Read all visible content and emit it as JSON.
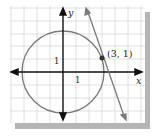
{
  "figure": {
    "axes": {
      "x_label": "x",
      "y_label": "y",
      "x_tick_label": "1",
      "y_tick_label": "1"
    },
    "circle": {
      "center": [
        0,
        0
      ],
      "radius_squared": 10,
      "color": "#7a7a7a"
    },
    "tangent_line": {
      "through": [
        3,
        1
      ],
      "slope": -3,
      "color": "#7a7a7a"
    },
    "point": {
      "label": "(3, 1)",
      "x": 3,
      "y": 1,
      "color": "#333333"
    },
    "grid_color": "#d8d8d8",
    "shadow_color": "#b5b5b5"
  }
}
